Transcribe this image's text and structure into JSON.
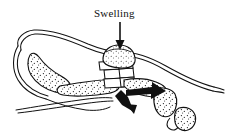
{
  "figure": {
    "domain": "Natural-Image",
    "kind": "anatomical-line-drawing",
    "background_color": "#ffffff",
    "ink_color": "#111111",
    "width": 227,
    "height": 136
  },
  "annotations": {
    "swelling_label": "Swelling",
    "swelling_label_position": {
      "x": 94,
      "y": 8
    }
  },
  "callouts": [
    {
      "name": "swelling-pointer-arrow",
      "style": "thin-line-with-solid-head",
      "from": {
        "x": 120,
        "y": 22
      },
      "to": {
        "x": 120,
        "y": 47
      },
      "direction": "down"
    },
    {
      "name": "displacement-arrow-down-left",
      "style": "thick-solid",
      "from": {
        "x": 122,
        "y": 92
      },
      "to": {
        "x": 134,
        "y": 114
      },
      "direction": "down-left"
    },
    {
      "name": "displacement-arrow-right",
      "style": "thick-solid",
      "from": {
        "x": 128,
        "y": 94
      },
      "to": {
        "x": 163,
        "y": 92
      },
      "direction": "right"
    }
  ],
  "structures": [
    {
      "name": "soft-tissue-outline-upper",
      "description": "long curved double outline across top of foot"
    },
    {
      "name": "soft-tissue-outline-lower",
      "description": "thin curved outline along plantar surface"
    },
    {
      "name": "calcaneus",
      "description": "stippled heel bone at left"
    },
    {
      "name": "metatarsal-shaft",
      "description": "stippled elongated bone through mid foot"
    },
    {
      "name": "tarsal-joint-segments",
      "description": "stacked small bone blocks at mid foot"
    },
    {
      "name": "swelling-mass",
      "description": "stippled rounded swelling at dorsal mid foot"
    },
    {
      "name": "proximal-phalanx",
      "description": "stippled bone segment lower right"
    },
    {
      "name": "distal-phalanx",
      "description": "small stippled bone segment at far lower right"
    }
  ]
}
